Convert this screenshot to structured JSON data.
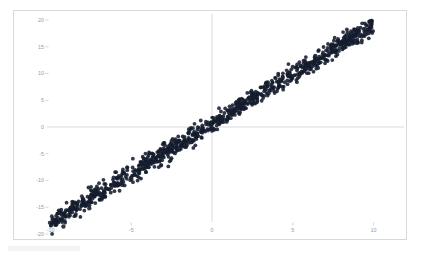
{
  "chart_data": {
    "type": "scatter",
    "title": "",
    "subtitle": "",
    "xlabel": "",
    "ylabel": "",
    "xlim": [
      -11.5,
      11.0
    ],
    "ylim": [
      -20.5,
      21.5
    ],
    "xticks": [
      -10,
      -5,
      0,
      5,
      10
    ],
    "xtick_labels": [
      "-10",
      "-5",
      "0",
      "5",
      "10"
    ],
    "yticks": [
      20,
      15,
      10,
      5,
      0,
      -5,
      -10,
      -15,
      -20
    ],
    "ytick_labels": [
      "20",
      "15",
      "10",
      "5",
      "0",
      "-5",
      "-10",
      "-15",
      "-20"
    ],
    "grid": false,
    "legend": null,
    "legend_position": "none",
    "annotations": [],
    "series": [
      {
        "name": "observations",
        "marker": "circle",
        "marker_color": "#141c2e",
        "marker_size": 1.9,
        "n_points": 1000,
        "description": "Tight positively-correlated linear band; slope about 1.85, intercept about 0.6, residual spread about 0.8, saturating near y = 20 at the right end.",
        "model": {
          "slope": 1.85,
          "intercept": 0.6,
          "noise_sd": 0.85,
          "x_min": -10.1,
          "x_max": 10.0,
          "y_clip_max": 20.0
        },
        "sample_points": [
          [
            -10.05,
            -17.6
          ],
          [
            -9.9,
            -17.2
          ],
          [
            -9.8,
            -16.9
          ],
          [
            -9.7,
            -17.9
          ],
          [
            -9.6,
            -16.4
          ],
          [
            -9.4,
            -16.8
          ],
          [
            -9.2,
            -18.6
          ],
          [
            -9.0,
            -16.0
          ],
          [
            -8.8,
            -15.5
          ],
          [
            -8.6,
            -15.1
          ],
          [
            -8.4,
            -14.7
          ],
          [
            -8.2,
            -14.2
          ],
          [
            -8.0,
            -14.0
          ],
          [
            -7.8,
            -13.6
          ],
          [
            -7.6,
            -15.2
          ],
          [
            -7.4,
            -12.9
          ],
          [
            -7.2,
            -12.5
          ],
          [
            -7.0,
            -12.2
          ],
          [
            -6.8,
            -11.8
          ],
          [
            -6.6,
            -11.4
          ],
          [
            -6.4,
            -11.1
          ],
          [
            -6.2,
            -10.7
          ],
          [
            -6.0,
            -10.4
          ],
          [
            -5.8,
            -10.0
          ],
          [
            -5.6,
            -9.7
          ],
          [
            -5.4,
            -9.3
          ],
          [
            -5.2,
            -9.0
          ],
          [
            -5.0,
            -8.6
          ],
          [
            -4.8,
            -8.3
          ],
          [
            -4.6,
            -7.9
          ],
          [
            -4.4,
            -7.6
          ],
          [
            -4.2,
            -7.2
          ],
          [
            -4.0,
            -6.9
          ],
          [
            -3.8,
            -6.5
          ],
          [
            -3.6,
            -6.2
          ],
          [
            -3.4,
            -5.8
          ],
          [
            -3.2,
            -5.4
          ],
          [
            -3.0,
            -5.0
          ],
          [
            -2.8,
            -4.7
          ],
          [
            -2.6,
            -4.3
          ],
          [
            -2.4,
            -3.9
          ],
          [
            -2.2,
            -3.5
          ],
          [
            -2.0,
            -3.1
          ],
          [
            -1.8,
            -2.7
          ],
          [
            -1.6,
            -2.4
          ],
          [
            -1.4,
            -2.0
          ],
          [
            -1.2,
            -1.6
          ],
          [
            -1.0,
            -1.3
          ],
          [
            -0.8,
            -0.9
          ],
          [
            -0.6,
            -0.5
          ],
          [
            -0.4,
            -0.1
          ],
          [
            -0.2,
            0.3
          ],
          [
            0.0,
            0.6
          ],
          [
            0.2,
            1.0
          ],
          [
            0.4,
            1.3
          ],
          [
            0.6,
            1.7
          ],
          [
            0.8,
            2.1
          ],
          [
            1.0,
            2.4
          ],
          [
            1.2,
            2.8
          ],
          [
            1.4,
            3.2
          ],
          [
            1.6,
            3.6
          ],
          [
            1.8,
            3.9
          ],
          [
            2.0,
            4.3
          ],
          [
            2.2,
            4.7
          ],
          [
            2.4,
            5.0
          ],
          [
            2.6,
            5.4
          ],
          [
            2.8,
            5.8
          ],
          [
            3.0,
            6.1
          ],
          [
            3.2,
            6.5
          ],
          [
            3.4,
            6.9
          ],
          [
            3.5,
            6.3
          ],
          [
            3.6,
            7.3
          ],
          [
            3.8,
            7.6
          ],
          [
            4.0,
            8.0
          ],
          [
            4.2,
            8.4
          ],
          [
            4.4,
            8.7
          ],
          [
            4.6,
            9.1
          ],
          [
            4.8,
            9.5
          ],
          [
            5.0,
            9.8
          ],
          [
            5.2,
            10.2
          ],
          [
            5.4,
            10.6
          ],
          [
            5.6,
            11.0
          ],
          [
            5.8,
            11.3
          ],
          [
            6.0,
            11.7
          ],
          [
            6.2,
            12.1
          ],
          [
            6.4,
            12.4
          ],
          [
            6.6,
            12.8
          ],
          [
            6.8,
            13.2
          ],
          [
            7.0,
            13.5
          ],
          [
            7.2,
            13.9
          ],
          [
            7.4,
            14.3
          ],
          [
            7.6,
            14.7
          ],
          [
            7.8,
            15.0
          ],
          [
            8.0,
            15.4
          ],
          [
            8.2,
            15.8
          ],
          [
            8.4,
            16.1
          ],
          [
            8.6,
            16.9
          ],
          [
            8.8,
            17.5
          ],
          [
            9.0,
            18.2
          ],
          [
            9.2,
            18.8
          ],
          [
            9.4,
            19.3
          ],
          [
            9.6,
            19.7
          ],
          [
            9.8,
            19.9
          ],
          [
            10.0,
            20.0
          ]
        ]
      }
    ]
  },
  "axes": {
    "origin_vertical_line": "x=0",
    "origin_horizontal_line": "y=0"
  }
}
